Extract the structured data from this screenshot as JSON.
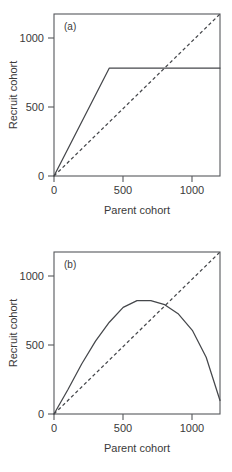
{
  "figure": {
    "background": "#ffffff",
    "line_color": "#45474b",
    "axis_color": "#56585c"
  },
  "chart_data": [
    {
      "type": "line",
      "panel_label": "(a)",
      "title": "",
      "xlabel": "Parent cohort",
      "ylabel": "Recruit cohort",
      "xlim": [
        0,
        1200
      ],
      "ylim": [
        0,
        1200
      ],
      "xticks": [
        0,
        500,
        1000
      ],
      "xtick_labels": [
        "0",
        "500",
        "1000"
      ],
      "yticks": [
        0,
        500,
        1000
      ],
      "ytick_labels": [
        "0",
        "500",
        "1000"
      ],
      "grid": false,
      "legend": "none",
      "series": [
        {
          "name": "Stock-recruitment curve (hockey stick)",
          "style": "solid",
          "x": [
            0,
            400,
            1200
          ],
          "values": [
            0,
            800,
            800
          ]
        },
        {
          "name": "Replacement line (1:1)",
          "style": "dashed",
          "x": [
            0,
            1200
          ],
          "values": [
            0,
            1200
          ]
        }
      ],
      "annotations": {
        "breakpoint_x": 400,
        "plateau_y": 800,
        "equilibrium_x": 800
      }
    },
    {
      "type": "line",
      "panel_label": "(b)",
      "title": "",
      "xlabel": "Parent cohort",
      "ylabel": "Recruit cohort",
      "xlim": [
        0,
        1200
      ],
      "ylim": [
        0,
        1200
      ],
      "xticks": [
        0,
        500,
        1000
      ],
      "xtick_labels": [
        "0",
        "500",
        "1000"
      ],
      "yticks": [
        0,
        500,
        1000
      ],
      "ytick_labels": [
        "0",
        "500",
        "1000"
      ],
      "grid": false,
      "legend": "none",
      "series": [
        {
          "name": "Stock-recruitment curve (dome shaped)",
          "style": "solid",
          "x": [
            0,
            100,
            200,
            300,
            400,
            500,
            600,
            700,
            800,
            900,
            1000,
            1100,
            1200
          ],
          "values": [
            0,
            180,
            370,
            540,
            680,
            790,
            840,
            840,
            810,
            740,
            620,
            420,
            100
          ]
        },
        {
          "name": "Replacement line (1:1)",
          "style": "dashed",
          "x": [
            0,
            1200
          ],
          "values": [
            0,
            1200
          ]
        }
      ],
      "annotations": {
        "peak_x": 650,
        "peak_y": 840,
        "equilibrium_x": 820
      }
    }
  ]
}
